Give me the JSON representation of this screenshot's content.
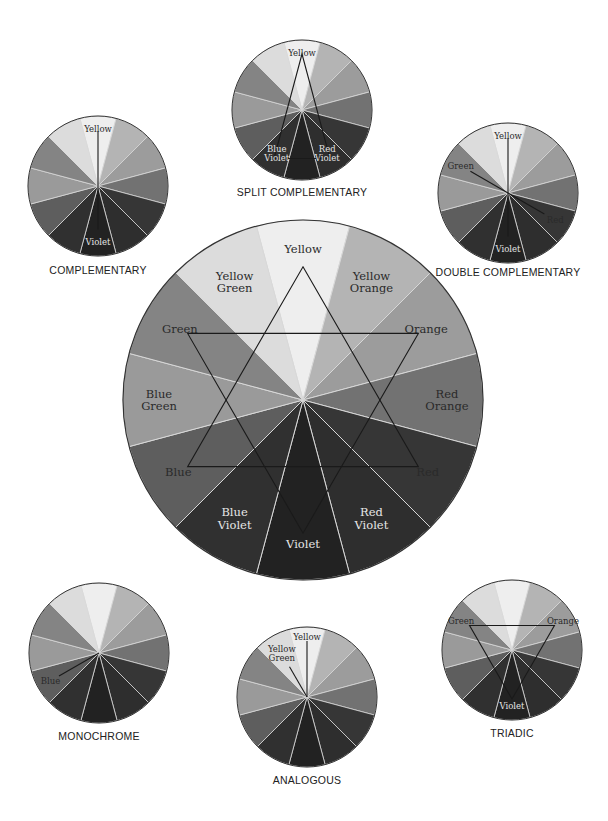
{
  "segment_order": [
    "Yellow",
    "Yellow Orange",
    "Orange",
    "Red Orange",
    "Red",
    "Red Violet",
    "Violet",
    "Blue Violet",
    "Blue",
    "Blue Green",
    "Green",
    "Yellow Green"
  ],
  "segment_shades": {
    "Yellow": "#eeeeee",
    "Yellow Orange": "#b4b4b4",
    "Orange": "#9c9c9c",
    "Red Orange": "#727272",
    "Red": "#363636",
    "Red Violet": "#2e2e2e",
    "Violet": "#222222",
    "Blue Violet": "#303030",
    "Blue": "#5e5e5e",
    "Blue Green": "#9a9a9a",
    "Green": "#848484",
    "Yellow Green": "#dcdcdc"
  },
  "colors": {
    "background": "#ffffff",
    "divider": "#d8d8d8",
    "outline": "#333333",
    "line": "#1a1a1a",
    "label_dark": "#2a2a2a",
    "label_light": "#e6e6e6"
  },
  "main_wheel": {
    "name": "color-wheel",
    "cx": 303,
    "cy": 400,
    "r": 180,
    "labels": [
      {
        "text": [
          "Yellow"
        ],
        "angle": 0,
        "dist": 0.84,
        "light": false
      },
      {
        "text": [
          "Yellow",
          "Orange"
        ],
        "angle": 30,
        "dist": 0.76,
        "light": false
      },
      {
        "text": [
          "Orange"
        ],
        "angle": 60,
        "dist": 0.79,
        "light": false
      },
      {
        "text": [
          "Red",
          "Orange"
        ],
        "angle": 90,
        "dist": 0.8,
        "light": false
      },
      {
        "text": [
          "Red"
        ],
        "angle": 120,
        "dist": 0.8,
        "light": false
      },
      {
        "text": [
          "Red",
          "Violet"
        ],
        "angle": 150,
        "dist": 0.76,
        "light": true
      },
      {
        "text": [
          "Violet"
        ],
        "angle": 180,
        "dist": 0.8,
        "light": true
      },
      {
        "text": [
          "Blue",
          "Violet"
        ],
        "angle": 210,
        "dist": 0.76,
        "light": true
      },
      {
        "text": [
          "Blue"
        ],
        "angle": 240,
        "dist": 0.8,
        "light": false
      },
      {
        "text": [
          "Blue",
          "Green"
        ],
        "angle": 270,
        "dist": 0.8,
        "light": false
      },
      {
        "text": [
          "Green"
        ],
        "angle": 300,
        "dist": 0.79,
        "light": false
      },
      {
        "text": [
          "Yellow",
          "Green"
        ],
        "angle": 330,
        "dist": 0.76,
        "light": false
      }
    ],
    "triangles": [
      [
        0,
        120,
        240
      ],
      [
        60,
        180,
        300
      ]
    ],
    "triangle_radius": 0.74
  },
  "schemes": [
    {
      "id": "split-complementary",
      "caption": "SPLIT COMPLEMENTARY",
      "cx": 302,
      "cy": 110,
      "r": 70,
      "caption_y": 196,
      "labels": [
        {
          "text": [
            "Yellow"
          ],
          "angle": 0,
          "dist": 0.82,
          "light": false
        },
        {
          "text": [
            "Blue",
            "Violet"
          ],
          "angle": 210,
          "dist": 0.72,
          "light": true
        },
        {
          "text": [
            "Red",
            "Violet"
          ],
          "angle": 150,
          "dist": 0.72,
          "light": true
        }
      ],
      "polygon": [
        0,
        150,
        210
      ],
      "polygon_radius": 0.8,
      "rays": []
    },
    {
      "id": "complementary",
      "caption": "COMPLEMENTARY",
      "cx": 98,
      "cy": 186,
      "r": 70,
      "caption_y": 274,
      "labels": [
        {
          "text": [
            "Yellow"
          ],
          "angle": 0,
          "dist": 0.82,
          "light": false
        },
        {
          "text": [
            "Violet"
          ],
          "angle": 180,
          "dist": 0.8,
          "light": true
        }
      ],
      "polygon": [],
      "rays": [
        {
          "angle": 0,
          "len": 0.78
        },
        {
          "angle": 180,
          "len": 0.62
        }
      ]
    },
    {
      "id": "double-complementary",
      "caption": "DOUBLE COMPLEMENTARY",
      "cx": 508,
      "cy": 193,
      "r": 70,
      "caption_y": 276,
      "labels": [
        {
          "text": [
            "Yellow"
          ],
          "angle": 0,
          "dist": 0.82,
          "light": false
        },
        {
          "text": [
            "Green"
          ],
          "angle": 300,
          "dist": 0.78,
          "light": false
        },
        {
          "text": [
            "Red"
          ],
          "angle": 120,
          "dist": 0.78,
          "light": false
        },
        {
          "text": [
            "Violet"
          ],
          "angle": 180,
          "dist": 0.8,
          "light": true
        }
      ],
      "polygon": [],
      "rays": [
        {
          "angle": 0,
          "len": 0.78
        },
        {
          "angle": 300,
          "len": 0.62
        },
        {
          "angle": 120,
          "len": 0.6
        },
        {
          "angle": 180,
          "len": 0.62
        }
      ]
    },
    {
      "id": "monochrome",
      "caption": "MONOCHROME",
      "cx": 99,
      "cy": 653,
      "r": 70,
      "caption_y": 740,
      "labels": [
        {
          "text": [
            "Blue"
          ],
          "angle": 240,
          "dist": 0.8,
          "light": false
        }
      ],
      "polygon": [],
      "rays": [
        {
          "angle": 240,
          "len": 0.66
        }
      ]
    },
    {
      "id": "analogous",
      "caption": "ANALOGOUS",
      "cx": 307,
      "cy": 697,
      "r": 70,
      "caption_y": 784,
      "labels": [
        {
          "text": [
            "Yellow"
          ],
          "angle": 0,
          "dist": 0.85,
          "light": false
        },
        {
          "text": [
            "Yellow",
            "Green"
          ],
          "angle": 330,
          "dist": 0.72,
          "light": false
        }
      ],
      "polygon": [],
      "rays": [
        {
          "angle": 0,
          "len": 0.8
        },
        {
          "angle": 330,
          "len": 0.5
        }
      ]
    },
    {
      "id": "triadic",
      "caption": "TRIADIC",
      "cx": 512,
      "cy": 650,
      "r": 70,
      "caption_y": 737,
      "labels": [
        {
          "text": [
            "Green"
          ],
          "angle": 300,
          "dist": 0.84,
          "light": false
        },
        {
          "text": [
            "Orange"
          ],
          "angle": 60,
          "dist": 0.84,
          "light": false
        },
        {
          "text": [
            "Violet"
          ],
          "angle": 180,
          "dist": 0.8,
          "light": true
        }
      ],
      "polygon": [
        300,
        60,
        180
      ],
      "polygon_radius": 0.7,
      "rays": []
    }
  ]
}
